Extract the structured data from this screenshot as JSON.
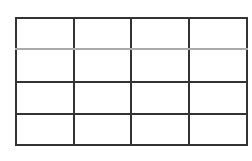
{
  "grid": {
    "rows": 4,
    "columns": 4,
    "line_color": "#333333",
    "faint_line_color": "#aaaaaa",
    "cells": [
      [
        "",
        "",
        "",
        ""
      ],
      [
        "",
        "",
        "",
        ""
      ],
      [
        "",
        "",
        "",
        ""
      ],
      [
        "",
        "",
        "",
        ""
      ]
    ]
  }
}
